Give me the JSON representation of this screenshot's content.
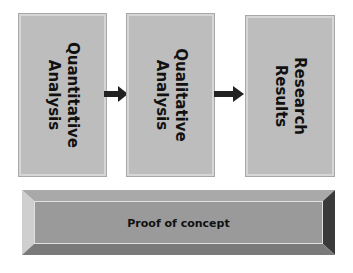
{
  "diagram": {
    "boxes": [
      {
        "line1": "Quantitative",
        "line2": "Analysis"
      },
      {
        "line1": "Qualitative",
        "line2": "Analysis"
      },
      {
        "line1": "Research",
        "line2": "Results"
      }
    ],
    "arrows": [
      "right-arrow",
      "right-arrow"
    ],
    "footer": {
      "label": "Proof of concept"
    },
    "colors": {
      "box_fill": "#bdbdbd",
      "arrow": "#222222",
      "bevel_face": "#9a9a9a",
      "bevel_dark": "#3a3a3a",
      "bevel_light": "#cfcfcf"
    }
  }
}
